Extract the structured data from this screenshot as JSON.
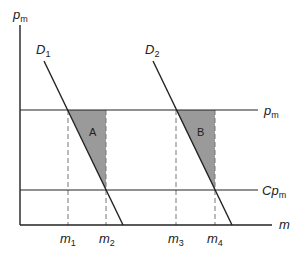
{
  "diagram": {
    "type": "economics-supply-demand",
    "axes": {
      "y_label": "p",
      "y_label_sub": "m",
      "x_label": "m"
    },
    "horizontal_lines": [
      {
        "id": "pm",
        "label": "p",
        "label_sub": "m"
      },
      {
        "id": "cpm",
        "label": "Cp",
        "label_sub": "m"
      }
    ],
    "demand_curves": [
      {
        "id": "D1",
        "label": "D",
        "label_sub": "1"
      },
      {
        "id": "D2",
        "label": "D",
        "label_sub": "2"
      }
    ],
    "x_ticks": [
      {
        "label": "m",
        "sub": "1"
      },
      {
        "label": "m",
        "sub": "2"
      },
      {
        "label": "m",
        "sub": "3"
      },
      {
        "label": "m",
        "sub": "4"
      }
    ],
    "shaded_areas": [
      {
        "id": "A",
        "label": "A"
      },
      {
        "id": "B",
        "label": "B"
      }
    ],
    "colors": {
      "line": "#222222",
      "dashed": "#777777",
      "shade": "#9a9a9a"
    }
  }
}
